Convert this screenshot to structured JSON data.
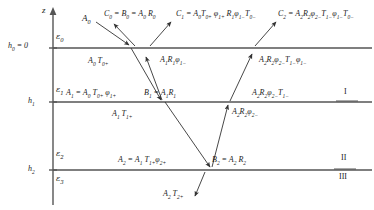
{
  "figure": {
    "kind": "layered-media-wave-diagram",
    "axis_label": "z",
    "line_color": "#555555",
    "arrow_color": "#333333",
    "interfaces": [
      {
        "name": "h0",
        "label_html": "h<sub>0</sub> = 0",
        "y": 48
      },
      {
        "name": "h1",
        "label_html": "h<sub>1</sub>",
        "y": 102
      },
      {
        "name": "h2",
        "label_html": "h<sub>2</sub>",
        "y": 170
      }
    ],
    "permittivities": [
      {
        "name": "eps0",
        "label_html": "&#949;<sub>0</sub>",
        "x": 56,
        "y": 38
      },
      {
        "name": "eps1",
        "label_html": "&#949;<sub>1</sub>",
        "x": 56,
        "y": 92
      },
      {
        "name": "eps2",
        "label_html": "&#949;<sub>2</sub>",
        "x": 56,
        "y": 155
      },
      {
        "name": "eps3",
        "label_html": "&#949;<sub>3</sub>",
        "x": 56,
        "y": 180
      }
    ],
    "regions": [
      {
        "name": "region-I",
        "numeral": "I",
        "x": 344,
        "y": 92
      },
      {
        "name": "region-II",
        "numeral": "II",
        "x": 341,
        "y": 158
      },
      {
        "name": "region-III",
        "numeral": "III",
        "x": 339,
        "y": 176
      }
    ],
    "annotations": [
      {
        "id": "a0",
        "name": "incident-wave-A0",
        "html": "A<sub>0</sub>",
        "x": 82,
        "y": 14,
        "size": "f9"
      },
      {
        "id": "c0",
        "name": "reflected-C0-expression",
        "html": "C<sub>0</sub> = B<sub>0</sub> = A<sub>0</sub> R<sub>0</sub>",
        "x": 104,
        "y": 10,
        "size": "f8"
      },
      {
        "id": "c1",
        "name": "reflected-C1-expression",
        "html": "C<sub>1</sub> = A<sub>0</sub>T<sub>0+</sub> &#966;<sub>1+</sub> R<sub>1</sub>&#966;<sub>1&#8722;</sub>T<sub>0&#8722;</sub>",
        "x": 176,
        "y": 10,
        "size": "f8"
      },
      {
        "id": "c2",
        "name": "reflected-C2-expression",
        "html": "C<sub>2</sub> = A<sub>2</sub>R<sub>2</sub>&#966;<sub>2&#8722;</sub>T<sub>1&#8722;</sub>&#966;<sub>1&#8722;</sub>T<sub>0&#8722;</sub>",
        "x": 278,
        "y": 10,
        "size": "f8"
      },
      {
        "id": "a0t0",
        "name": "transmitted-A0T0plus",
        "html": "A<sub>0</sub> T<sub>0+</sub>",
        "x": 88,
        "y": 57,
        "size": "f8"
      },
      {
        "id": "a1r1phi",
        "name": "upward-A1R1phi1minus",
        "html": "A<sub>1</sub>R<sub>1</sub>&#966;<sub>1&#8722;</sub>",
        "x": 160,
        "y": 56,
        "size": "f8"
      },
      {
        "id": "a2r2t1phi",
        "name": "upward-A2R2phi2minusT1minusphi1minus",
        "html": "A<sub>2</sub>R<sub>2</sub>&#966;<sub>2&#8722;</sub>T<sub>1&#8722;</sub>&#966;<sub>1&#8722;</sub>",
        "x": 259,
        "y": 56,
        "size": "f8"
      },
      {
        "id": "a1eq",
        "name": "amplitude-A1-definition",
        "html": "A<sub>1</sub> = A<sub>0</sub> T<sub>0+</sub> &#966;<sub>1+</sub>",
        "x": 66,
        "y": 89,
        "size": "f8"
      },
      {
        "id": "b1eq",
        "name": "amplitude-B1-definition",
        "html": "B<sub>1</sub> = A<sub>1</sub>R<sub>1</sub>",
        "x": 144,
        "y": 89,
        "size": "f8"
      },
      {
        "id": "a2r2t1",
        "name": "upward-A2R2phi2minusT1minus",
        "html": "A<sub>2</sub>R<sub>2</sub>&#966;<sub>2&#8722;</sub>T<sub>1&#8722;</sub>",
        "x": 252,
        "y": 89,
        "size": "f8"
      },
      {
        "id": "a1t1",
        "name": "transmitted-A1T1plus",
        "html": "A<sub>1</sub> T<sub>1+</sub>",
        "x": 112,
        "y": 110,
        "size": "f8"
      },
      {
        "id": "a2r2phi",
        "name": "upward-A2R2phi2minus",
        "html": "A<sub>2</sub>R<sub>2</sub>&#966;<sub>2&#8722;</sub>",
        "x": 232,
        "y": 108,
        "size": "f8"
      },
      {
        "id": "a2eq",
        "name": "amplitude-A2-definition",
        "html": "A<sub>2</sub> = A<sub>1</sub> T<sub>1+</sub>&#966;<sub>2+</sub>",
        "x": 118,
        "y": 156,
        "size": "f8"
      },
      {
        "id": "b2eq",
        "name": "amplitude-B2-definition",
        "html": "B<sub>2</sub> = A<sub>2</sub> R<sub>2</sub>",
        "x": 212,
        "y": 156,
        "size": "f8"
      },
      {
        "id": "a2t2",
        "name": "transmitted-A2T2plus",
        "html": "A<sub>2</sub> T<sub>2+</sub>",
        "x": 163,
        "y": 190,
        "size": "f8"
      }
    ],
    "rays": [
      {
        "name": "ray-incident-A0",
        "x1": 96,
        "y1": 22,
        "x2": 129,
        "y2": 45,
        "arrow": "end"
      },
      {
        "name": "ray-reflected-C0",
        "x1": 135,
        "y1": 46,
        "x2": 114,
        "y2": 24,
        "arrow": "end"
      },
      {
        "name": "ray-down-layer1",
        "x1": 131,
        "y1": 48,
        "x2": 161,
        "y2": 100,
        "arrow": "end"
      },
      {
        "name": "ray-up-layer1",
        "x1": 162,
        "y1": 100,
        "x2": 146,
        "y2": 57,
        "arrow": "end"
      },
      {
        "name": "ray-out-C1",
        "x1": 150,
        "y1": 46,
        "x2": 171,
        "y2": 22,
        "arrow": "end"
      },
      {
        "name": "ray-down-layer2",
        "x1": 165,
        "y1": 102,
        "x2": 210,
        "y2": 167,
        "arrow": "end"
      },
      {
        "name": "ray-up-layer2",
        "x1": 212,
        "y1": 167,
        "x2": 228,
        "y2": 105,
        "arrow": "end"
      },
      {
        "name": "ray-up-layer1-right",
        "x1": 230,
        "y1": 101,
        "x2": 252,
        "y2": 54,
        "arrow": "end"
      },
      {
        "name": "ray-out-C2",
        "x1": 255,
        "y1": 46,
        "x2": 276,
        "y2": 22,
        "arrow": "end"
      },
      {
        "name": "ray-transmitted-A2T2",
        "x1": 205,
        "y1": 172,
        "x2": 195,
        "y2": 196,
        "arrow": "end"
      }
    ]
  }
}
